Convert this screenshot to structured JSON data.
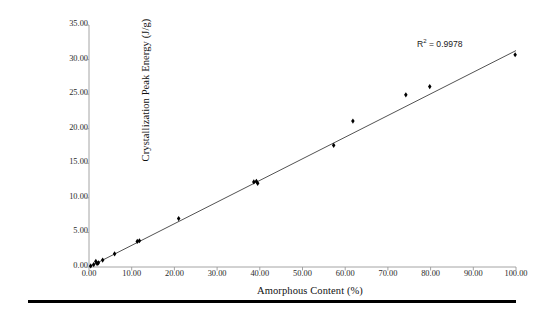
{
  "chart_data": {
    "type": "scatter",
    "title": "",
    "subtitle": "",
    "xlabel": "Amorphous Content (%)",
    "ylabel": "Crystallization Peak Energy (J/g)",
    "xlim": [
      0.0,
      100.0
    ],
    "ylim": [
      0.0,
      35.0
    ],
    "xticks": [
      "0.00",
      "10.00",
      "20.00",
      "30.00",
      "40.00",
      "50.00",
      "60.00",
      "70.00",
      "80.00",
      "90.00",
      "100.00"
    ],
    "yticks": [
      "0.00",
      "5.00",
      "10.00",
      "15.00",
      "20.00",
      "25.00",
      "30.00",
      "35.00"
    ],
    "xtick_values": [
      0,
      10,
      20,
      30,
      40,
      50,
      60,
      70,
      80,
      90,
      100
    ],
    "ytick_values": [
      0,
      5,
      10,
      15,
      20,
      25,
      30,
      35
    ],
    "grid": false,
    "legend": null,
    "legend_position": "none",
    "marker": "diamond",
    "marker_color": "#000000",
    "series": [
      {
        "name": "Crystallization Peak Energy",
        "marker": "diamond",
        "color": "#000000",
        "points": [
          {
            "x": 0.4,
            "y": 0.15
          },
          {
            "x": 1.1,
            "y": 0.35
          },
          {
            "x": 1.6,
            "y": 0.8
          },
          {
            "x": 1.9,
            "y": 0.5
          },
          {
            "x": 2.2,
            "y": 0.6
          },
          {
            "x": 3.2,
            "y": 1.0
          },
          {
            "x": 6.0,
            "y": 1.9
          },
          {
            "x": 11.3,
            "y": 3.7
          },
          {
            "x": 11.8,
            "y": 3.8
          },
          {
            "x": 21.0,
            "y": 7.0
          },
          {
            "x": 38.6,
            "y": 12.3
          },
          {
            "x": 39.2,
            "y": 12.4
          },
          {
            "x": 39.5,
            "y": 12.1
          },
          {
            "x": 57.3,
            "y": 17.6
          },
          {
            "x": 61.8,
            "y": 21.1
          },
          {
            "x": 74.2,
            "y": 24.9
          },
          {
            "x": 79.8,
            "y": 26.1
          },
          {
            "x": 99.8,
            "y": 30.7
          }
        ]
      }
    ],
    "trendline": {
      "type": "linear",
      "r_squared": 0.9978,
      "r_squared_label": "R",
      "r_squared_superscript": "2",
      "r_squared_value_text": "= 0.9978",
      "annotation_text": "R2 = 0.9978",
      "x_start": 0.0,
      "y_start": 0.0,
      "x_end": 100.0,
      "y_end": 31.3,
      "color": "#333333"
    }
  },
  "axes": {
    "x_axis_color": "#9a9a9a",
    "y_axis_color": "#9a9a9a",
    "tick_color": "#9a9a9a"
  },
  "decorations": {
    "bottom_rule_color": "#000000"
  }
}
